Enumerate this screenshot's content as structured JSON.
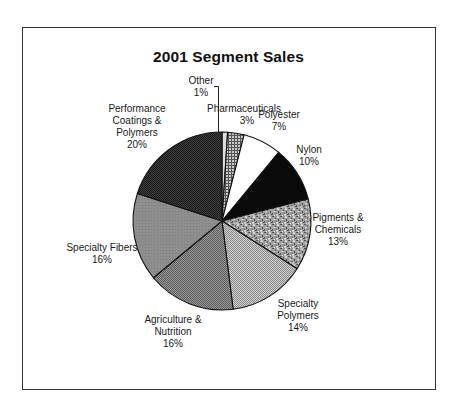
{
  "chart_data": {
    "type": "pie",
    "title": "2001 Segment Sales",
    "start_angle_deg": 0,
    "direction": "clockwise",
    "center": [
      222,
      221
    ],
    "radius": 89,
    "slices": [
      {
        "label": "Other",
        "value": 1,
        "display": "1%",
        "fill": "#dcdcdc",
        "pattern": "solid-light"
      },
      {
        "label": "Pharmaceuticals",
        "value": 3,
        "display": "3%",
        "fill": "#9a9a9a",
        "pattern": "grid"
      },
      {
        "label": "Polyester",
        "value": 7,
        "display": "7%",
        "fill": "#ffffff",
        "pattern": "solid"
      },
      {
        "label": "Nylon",
        "value": 10,
        "display": "10%",
        "fill": "#0a0a0a",
        "pattern": "solid"
      },
      {
        "label": "Pigments & Chemicals",
        "value": 13,
        "display": "13%",
        "fill": "#8a8a8a",
        "pattern": "mottled"
      },
      {
        "label": "Specialty Polymers",
        "value": 14,
        "display": "14%",
        "fill": "#b2b2b2",
        "pattern": "checker-light"
      },
      {
        "label": "Agriculture & Nutrition",
        "value": 16,
        "display": "16%",
        "fill": "#7c7c7c",
        "pattern": "checker"
      },
      {
        "label": "Specialty Fibers",
        "value": 16,
        "display": "16%",
        "fill": "#8e8e8e",
        "pattern": "solid-gray"
      },
      {
        "label": "Performance Coatings & Polymers",
        "value": 20,
        "display": "20%",
        "fill": "#2c2c2c",
        "pattern": "checker-dark"
      }
    ]
  },
  "labels": {
    "other": {
      "lines": [
        "Other",
        "1%"
      ]
    },
    "pharmaceuticals": {
      "lines": [
        "Pharmaceuticals",
        "3%"
      ]
    },
    "polyester": {
      "lines": [
        "Polyester",
        "7%"
      ]
    },
    "nylon": {
      "lines": [
        "Nylon",
        "10%"
      ]
    },
    "pigments": {
      "lines": [
        "Pigments &",
        "Chemicals",
        "13%"
      ]
    },
    "specialty_polymers": {
      "lines": [
        "Specialty",
        "Polymers",
        "14%"
      ]
    },
    "agriculture": {
      "lines": [
        "Agriculture &",
        "Nutrition",
        "16%"
      ]
    },
    "specialty_fibers": {
      "lines": [
        "Specialty Fibers",
        "16%"
      ]
    },
    "performance": {
      "lines": [
        "Performance",
        "Coatings &",
        "Polymers",
        "20%"
      ]
    }
  }
}
